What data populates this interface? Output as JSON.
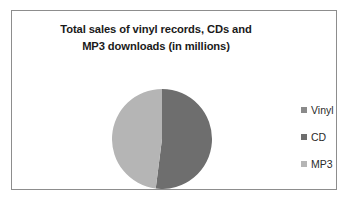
{
  "chart_data": {
    "type": "pie",
    "title": "Total sales of vinyl records, CDs and MP3 downloads (in millions)",
    "title_lines": [
      "Total sales of vinyl records, CDs and",
      "MP3 downloads  (in millions)"
    ],
    "categories": [
      "Vinyl",
      "CD",
      "MP3"
    ],
    "values": [
      0,
      52,
      48
    ],
    "units": "millions",
    "legend_position": "right",
    "grid": false,
    "xlabel": "",
    "ylabel": "",
    "slice_colors": [
      "#8a8a8a",
      "#6e6e6e",
      "#b5b5b5"
    ],
    "slices": [
      {
        "label": "Vinyl",
        "value": 0,
        "percent": 0,
        "color": "#8a8a8a",
        "start_angle": 0,
        "end_angle": 0
      },
      {
        "label": "CD",
        "value": 52,
        "percent": 52,
        "color": "#6e6e6e",
        "start_angle": 0,
        "end_angle": 187
      },
      {
        "label": "MP3",
        "value": 48,
        "percent": 48,
        "color": "#b5b5b5",
        "start_angle": 187,
        "end_angle": 360
      }
    ]
  },
  "legend": {
    "items": [
      {
        "label": "Vinyl",
        "color": "#8a8a8a"
      },
      {
        "label": "CD",
        "color": "#6e6e6e"
      },
      {
        "label": "MP3",
        "color": "#b5b5b5"
      }
    ]
  },
  "frame": {
    "border_color": "#8d8d8d",
    "background": "#ffffff"
  }
}
